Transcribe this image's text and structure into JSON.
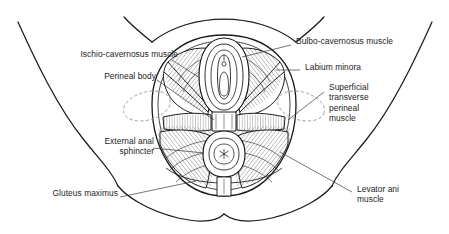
{
  "figure": {
    "domain_note": "anatomical line drawing",
    "background_color": "#ffffff",
    "ink_color": "#1a1a1a",
    "dashed_guide_color": "#9a9a9a",
    "stipple_color": "#8c8c8c",
    "text_color": "#1c1c1c"
  },
  "labels": [
    {
      "id": "ischio-cavernosus",
      "lines": [
        "Ischio-cavernosus muscle"
      ],
      "align": "right",
      "x": 46,
      "y": 54
    },
    {
      "id": "perineal-body",
      "lines": [
        "Perineal body"
      ],
      "align": "right",
      "x": 93,
      "y": 76
    },
    {
      "id": "external-anal-sphincter",
      "lines": [
        "External anal",
        "sphincter"
      ],
      "align": "right",
      "x": 90,
      "y": 141
    },
    {
      "id": "gluteus-maximus",
      "lines": [
        "Gluteus maximus"
      ],
      "align": "right",
      "x": 31,
      "y": 193
    },
    {
      "id": "bulbo-cavernosus",
      "lines": [
        "Bulbo-cavernosus muscle"
      ],
      "align": "left",
      "x": 294,
      "y": 41
    },
    {
      "id": "labium-minora",
      "lines": [
        "Labium minora"
      ],
      "align": "left",
      "x": 303,
      "y": 67
    },
    {
      "id": "superficial-transverse-perineal",
      "lines": [
        "Superficial",
        "transverse",
        "perineal",
        "muscle"
      ],
      "align": "left",
      "x": 327,
      "y": 86
    },
    {
      "id": "levator-ani",
      "lines": [
        "Levator ani",
        "muscle"
      ],
      "align": "left",
      "x": 355,
      "y": 189
    }
  ],
  "structures": [
    {
      "id": "body-outline-left-thigh",
      "description": "left thigh and hip contour"
    },
    {
      "id": "body-outline-right-thigh",
      "description": "right thigh and hip contour"
    },
    {
      "id": "pubic-arch",
      "description": "upper mons / pubic contour"
    },
    {
      "id": "buttock-left",
      "description": "left buttock lower curve"
    },
    {
      "id": "buttock-right",
      "description": "right buttock lower curve"
    },
    {
      "id": "perineal-field",
      "description": "central oval perineal region"
    },
    {
      "id": "vulval-opening",
      "description": "concentric labial rings with vestibule"
    },
    {
      "id": "anal-sphincter",
      "description": "concentric anal rings with stellate center"
    },
    {
      "id": "ischial-tuberosity-left",
      "description": "dashed ellipse left ischial tuberosity"
    },
    {
      "id": "ischial-tuberosity-right",
      "description": "dashed ellipse right ischial tuberosity"
    },
    {
      "id": "transverse-perineal-band",
      "description": "horizontal muscle band across midperineum"
    },
    {
      "id": "perineal-raphe",
      "description": "vertical band below anus"
    }
  ]
}
